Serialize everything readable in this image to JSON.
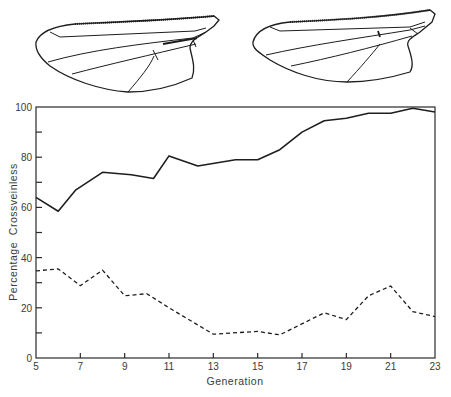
{
  "figure": {
    "wings": [
      {
        "label": "wing-with-crossveins"
      },
      {
        "label": "crossveinless-wing"
      }
    ]
  },
  "chart_data": {
    "type": "line",
    "title": "",
    "xlabel": "Generation",
    "ylabel": "Percentage  Crossveinless",
    "xlim": [
      5,
      23
    ],
    "ylim": [
      0,
      100
    ],
    "x_ticks": [
      5,
      7,
      9,
      11,
      13,
      15,
      17,
      19,
      21,
      23
    ],
    "x_tick_labels": [
      "5",
      "7",
      "9",
      "11",
      "13",
      "15",
      "17",
      "19",
      "21",
      "23"
    ],
    "y_ticks": [
      0,
      10,
      20,
      30,
      40,
      50,
      60,
      70,
      80,
      90,
      100
    ],
    "y_tick_labels": [
      "0",
      "20",
      "40",
      "60",
      "80",
      "100"
    ],
    "y_labeled_ticks": [
      0,
      20,
      40,
      60,
      80,
      100
    ],
    "grid": false,
    "legend": null,
    "series": [
      {
        "name": "upward selection (solid)",
        "style": "solid",
        "color": "#1e1e1e",
        "x": [
          5,
          6,
          6.8,
          8,
          9.3,
          10.3,
          11,
          12.3,
          14,
          15,
          16,
          17,
          18,
          19,
          20,
          21,
          22,
          23
        ],
        "values": [
          64,
          58.5,
          67,
          74,
          73,
          71.5,
          80.5,
          76.5,
          79,
          79,
          83,
          90,
          94.5,
          95.5,
          97.5,
          97.5,
          99.5,
          98
        ]
      },
      {
        "name": "downward selection (dashed)",
        "style": "dashed",
        "color": "#1e1e1e",
        "x": [
          5,
          6,
          7,
          8,
          9,
          10,
          11,
          13,
          15,
          16,
          18,
          19,
          20,
          21,
          22,
          23
        ],
        "values": [
          34.7,
          35.5,
          28.8,
          35,
          24.8,
          25.6,
          20,
          9.5,
          10.6,
          9.2,
          18,
          15.3,
          24.8,
          28.7,
          18.5,
          16.5
        ]
      }
    ]
  },
  "layout": {
    "plot": {
      "left": 36,
      "right": 435,
      "top": 107,
      "bottom": 358
    }
  }
}
